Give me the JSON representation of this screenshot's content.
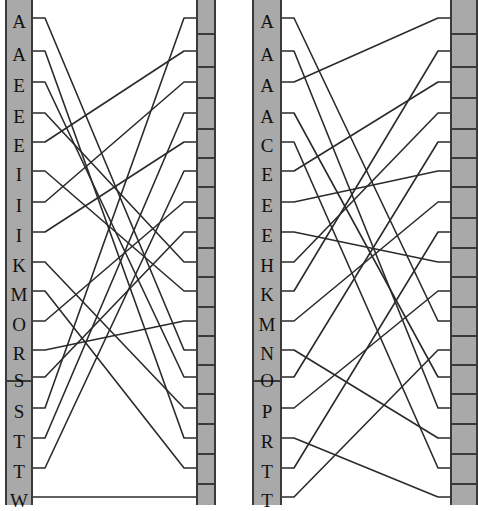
{
  "figure": {
    "type": "parallel-coordinates-matching",
    "width": 478,
    "height": 505,
    "background": "#ffffff",
    "axis_fill": "#a9a9a9",
    "axis_stroke": "#3a3a3a",
    "link_stroke": "#2b2b2b",
    "link_width": 1.6,
    "panel_count": 2
  },
  "panels": [
    {
      "name": "left-panel",
      "x": 5,
      "width": 211,
      "left_axis": {
        "name": "left-panel-left-axis",
        "x": 5,
        "width": 28,
        "labelled": true,
        "labels": [
          "A",
          "A",
          "E",
          "E",
          "E",
          "I",
          "I",
          "I",
          "K",
          "M",
          "O",
          "R",
          "S",
          "S",
          "T",
          "T",
          "W"
        ],
        "label_y": [
          12,
          45,
          76,
          107,
          136,
          165,
          196,
          226,
          256,
          285,
          315,
          344,
          371,
          402,
          432,
          462,
          491
        ],
        "tick_y": [
          18,
          51,
          82,
          113,
          142,
          171,
          202,
          232,
          262,
          291,
          321,
          350,
          377,
          408,
          438,
          468,
          497
        ],
        "segments": [
          {
            "top": 0,
            "bottom": 380
          },
          {
            "top": 380,
            "bottom": 505
          }
        ],
        "divider_y": [
          380
        ]
      },
      "right_axis": {
        "name": "left-panel-right-axis",
        "x": 196,
        "width": 20,
        "labelled": false,
        "tick_y": [
          18,
          51,
          82,
          113,
          142,
          171,
          202,
          232,
          262,
          291,
          321,
          350,
          377,
          408,
          438,
          468,
          497
        ],
        "divider_y": [
          33,
          66,
          97,
          128,
          157,
          186,
          217,
          247,
          276,
          306,
          335,
          364,
          393,
          423,
          453,
          483
        ]
      },
      "links": [
        {
          "left": 0,
          "right": 11
        },
        {
          "left": 1,
          "right": 14
        },
        {
          "left": 2,
          "right": 12
        },
        {
          "left": 3,
          "right": 8
        },
        {
          "left": 4,
          "right": 1
        },
        {
          "left": 5,
          "right": 9
        },
        {
          "left": 6,
          "right": 2
        },
        {
          "left": 7,
          "right": 4
        },
        {
          "left": 8,
          "right": 13
        },
        {
          "left": 9,
          "right": 15
        },
        {
          "left": 10,
          "right": 6
        },
        {
          "left": 11,
          "right": 10
        },
        {
          "left": 12,
          "right": 7
        },
        {
          "left": 13,
          "right": 0
        },
        {
          "left": 14,
          "right": 3
        },
        {
          "left": 15,
          "right": 5
        },
        {
          "left": 16,
          "right": 16
        }
      ]
    },
    {
      "name": "right-panel",
      "x": 252,
      "width": 226,
      "left_axis": {
        "name": "right-panel-left-axis",
        "x": 252,
        "width": 30,
        "labelled": true,
        "labels": [
          "A",
          "A",
          "A",
          "A",
          "C",
          "E",
          "E",
          "E",
          "H",
          "K",
          "M",
          "N",
          "O",
          "P",
          "R",
          "T",
          "T"
        ],
        "label_y": [
          12,
          45,
          76,
          107,
          136,
          165,
          196,
          226,
          256,
          285,
          315,
          344,
          371,
          402,
          432,
          462,
          491
        ],
        "tick_y": [
          18,
          51,
          82,
          113,
          142,
          171,
          202,
          232,
          262,
          291,
          321,
          350,
          377,
          408,
          438,
          468,
          497
        ],
        "segments": [
          {
            "top": 0,
            "bottom": 380
          },
          {
            "top": 380,
            "bottom": 505
          }
        ],
        "divider_y": [
          380
        ]
      },
      "right_axis": {
        "name": "right-panel-right-axis",
        "x": 450,
        "width": 28,
        "labelled": false,
        "tick_y": [
          18,
          51,
          82,
          113,
          142,
          171,
          202,
          232,
          262,
          291,
          321,
          350,
          377,
          408,
          438,
          468,
          497
        ],
        "divider_y": [
          33,
          66,
          97,
          128,
          157,
          186,
          217,
          247,
          276,
          306,
          335,
          364,
          393,
          423,
          453,
          483
        ]
      },
      "links": [
        {
          "left": 0,
          "right": 10
        },
        {
          "left": 1,
          "right": 13
        },
        {
          "left": 2,
          "right": 0
        },
        {
          "left": 3,
          "right": 12
        },
        {
          "left": 4,
          "right": 15
        },
        {
          "left": 5,
          "right": 2
        },
        {
          "left": 6,
          "right": 5
        },
        {
          "left": 7,
          "right": 8
        },
        {
          "left": 8,
          "right": 3
        },
        {
          "left": 9,
          "right": 1
        },
        {
          "left": 10,
          "right": 6
        },
        {
          "left": 11,
          "right": 14
        },
        {
          "left": 12,
          "right": 4
        },
        {
          "left": 13,
          "right": 9
        },
        {
          "left": 14,
          "right": 16
        },
        {
          "left": 15,
          "right": 7
        },
        {
          "left": 16,
          "right": 11
        }
      ]
    }
  ]
}
